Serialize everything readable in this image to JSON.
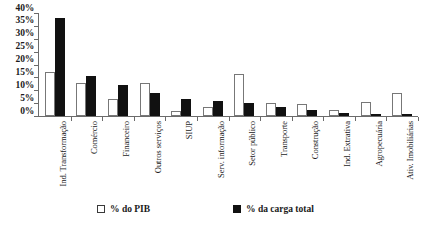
{
  "chart_data": {
    "type": "bar",
    "title": "",
    "xlabel": "",
    "ylabel": "",
    "ylim": [
      0,
      40
    ],
    "ytick_labels": [
      "40%",
      "35%",
      "30%",
      "25%",
      "20%",
      "15%",
      "10%",
      "5%",
      "0%"
    ],
    "ytick_values": [
      40,
      35,
      30,
      25,
      20,
      15,
      10,
      5,
      0
    ],
    "grid": false,
    "legend_position": "bottom",
    "categories": [
      "Ind. Transformação",
      "Comércio",
      "Financeiro",
      "Outros serviços",
      "SIUP",
      "Serv. informação",
      "Setor público",
      "Transporte",
      "Construção",
      "Ind. Extrativa",
      "Agropecuária",
      "Ativ. Imobiliárias"
    ],
    "series": [
      {
        "name": "% do PIB",
        "color": "#ffffff",
        "values": [
          17.0,
          12.8,
          6.5,
          13.0,
          2.0,
          3.5,
          16.5,
          5.0,
          4.5,
          2.5,
          5.5,
          9.0
        ]
      },
      {
        "name": "% da carga total",
        "color": "#111111",
        "values": [
          38.0,
          15.5,
          12.0,
          9.0,
          6.5,
          6.0,
          5.0,
          3.5,
          2.5,
          1.0,
          0.8,
          0.3
        ]
      }
    ]
  },
  "legend": {
    "items": [
      {
        "label": "% do PIB",
        "swatch": "white-square"
      },
      {
        "label": "% da carga total",
        "swatch": "black-square"
      }
    ]
  }
}
